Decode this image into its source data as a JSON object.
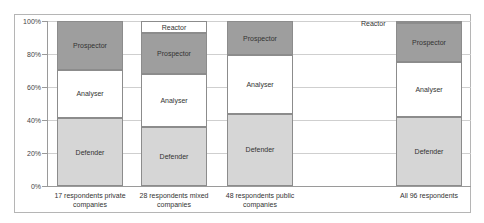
{
  "chart_data": {
    "type": "bar",
    "stacked": true,
    "normalized_percent": true,
    "title": "",
    "xlabel": "",
    "ylabel": "",
    "ylim": [
      0,
      100
    ],
    "yticks": [
      "0%",
      "20%",
      "40%",
      "60%",
      "80%",
      "100%"
    ],
    "grid": true,
    "legend": "none (segment labels drawn inside bars)",
    "categories": [
      "17 respondents private companies",
      "28 respondents mixed companies",
      "48 respondents public companies",
      "All 96 respondents"
    ],
    "series": [
      {
        "name": "Defender",
        "color": "#d6d6d6",
        "values": [
          41.2,
          35.7,
          43.8,
          41.7
        ]
      },
      {
        "name": "Analyser",
        "color": "#ffffff",
        "values": [
          29.4,
          32.1,
          35.4,
          33.3
        ]
      },
      {
        "name": "Prospector",
        "color": "#9e9e9e",
        "values": [
          29.4,
          25.0,
          20.8,
          24.0
        ]
      },
      {
        "name": "Reactor",
        "color": "#ffffff",
        "values": [
          0.0,
          7.1,
          0.0,
          1.0
        ]
      }
    ]
  },
  "labels": {
    "yticks": [
      "0%",
      "20%",
      "40%",
      "60%",
      "80%",
      "100%"
    ],
    "categories": [
      [
        "17 respondents private",
        "companies"
      ],
      [
        "28 respondents mixed",
        "companies"
      ],
      [
        "48 respondents public",
        "companies"
      ],
      [
        "All 96 respondents",
        ""
      ]
    ],
    "segments": {
      "defender": "Defender",
      "analyser": "Analyser",
      "prospector": "Prospector",
      "reactor": "Reactor"
    }
  }
}
